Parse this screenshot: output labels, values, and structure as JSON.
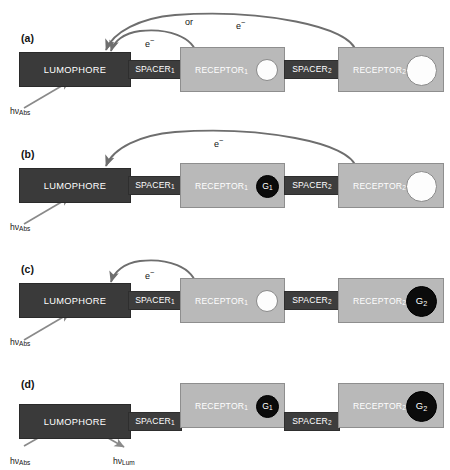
{
  "figure": {
    "caption_absent": true,
    "colors": {
      "lumophore_fill": "#3a3a3a",
      "spacer_fill": "#3d3d3d",
      "receptor_fill": "#b9b9b9",
      "guest_bound_fill": "#0b0b0b",
      "guest_free_fill": "#fdfdfd",
      "arrow_color": "#6e6e6e",
      "photon_arrow_color": "#8a8a8a",
      "text_on_dark": "#ffffff",
      "text_on_light": "#ffffff",
      "label_text": "#131313"
    },
    "block_labels": {
      "lumophore": "LUMOPHORE",
      "spacer_1": "SPACER",
      "spacer_1_sub": "1",
      "spacer_2": "SPACER",
      "spacer_2_sub": "2",
      "receptor_1": "RECEPTOR",
      "receptor_1_sub": "1",
      "receptor_2": "RECEPTOR",
      "receptor_2_sub": "2"
    },
    "guest_labels": {
      "g1": "G",
      "g1_sub": "1",
      "g2": "G",
      "g2_sub": "2"
    },
    "annotations": {
      "electron": "e",
      "electron_sup": "−",
      "or": "or",
      "photon_abs": "hν",
      "photon_abs_sub": "Abs",
      "photon_lum": "hν",
      "photon_lum_sub": "Lum"
    }
  },
  "panels": [
    {
      "id": "a",
      "label": "(a)",
      "receptor_1_state": "free",
      "receptor_2_state": "free",
      "electron_transfers": [
        {
          "from": "receptor_1",
          "to": "lumophore",
          "label": "e−"
        },
        {
          "from": "receptor_2",
          "to": "lumophore",
          "label": "e−"
        }
      ],
      "or_label": "or",
      "photons_in": [
        "hνAbs"
      ],
      "photons_out": [],
      "emission": false
    },
    {
      "id": "b",
      "label": "(b)",
      "receptor_1_state": "bound",
      "receptor_1_guest": "G1",
      "receptor_2_state": "free",
      "electron_transfers": [
        {
          "from": "receptor_2",
          "to": "lumophore",
          "label": "e−"
        }
      ],
      "or_label": "",
      "photons_in": [
        "hνAbs"
      ],
      "photons_out": [],
      "emission": false
    },
    {
      "id": "c",
      "label": "(c)",
      "receptor_1_state": "free",
      "receptor_2_state": "bound",
      "receptor_2_guest": "G2",
      "electron_transfers": [
        {
          "from": "receptor_1",
          "to": "lumophore",
          "label": "e−"
        }
      ],
      "or_label": "",
      "photons_in": [
        "hνAbs"
      ],
      "photons_out": [],
      "emission": false
    },
    {
      "id": "d",
      "label": "(d)",
      "receptor_1_state": "bound",
      "receptor_1_guest": "G1",
      "receptor_2_state": "bound",
      "receptor_2_guest": "G2",
      "electron_transfers": [],
      "or_label": "",
      "photons_in": [
        "hνAbs"
      ],
      "photons_out": [
        "hνLum"
      ],
      "emission": true
    }
  ]
}
